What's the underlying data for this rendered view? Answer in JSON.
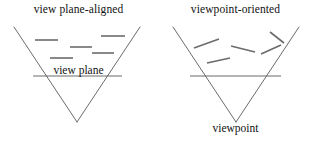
{
  "figure": {
    "background_color": "#ffffff",
    "stroke_color": "#5a5a5a",
    "slice_color": "#6b6b6b",
    "text_color": "#111111"
  },
  "panels": [
    {
      "id": "view-plane-aligned",
      "caption": "view plane-aligned",
      "inline_label": "view plane",
      "frustum": {
        "apex": [
          77,
          122
        ],
        "left_top": [
          14,
          27
        ],
        "right_top": [
          140,
          27
        ]
      },
      "plane_line": {
        "x1": 33,
        "y1": 76,
        "x2": 122,
        "y2": 76
      },
      "slices": [
        {
          "x1": 35,
          "y1": 40,
          "x2": 58,
          "y2": 40
        },
        {
          "x1": 101,
          "y1": 36,
          "x2": 125,
          "y2": 36
        },
        {
          "x1": 70,
          "y1": 47,
          "x2": 92,
          "y2": 47
        },
        {
          "x1": 92,
          "y1": 53,
          "x2": 114,
          "y2": 53
        },
        {
          "x1": 50,
          "y1": 58,
          "x2": 73,
          "y2": 58
        }
      ]
    },
    {
      "id": "viewpoint-oriented",
      "caption": "viewpoint-oriented",
      "inline_label": "viewpoint",
      "frustum": {
        "apex": [
          79,
          122
        ],
        "left_top": [
          16,
          27
        ],
        "right_top": [
          142,
          27
        ]
      },
      "plane_line": {
        "x1": 33,
        "y1": 76,
        "x2": 124,
        "y2": 76
      },
      "slices": [
        {
          "x1": 37,
          "y1": 48,
          "x2": 62,
          "y2": 39
        },
        {
          "x1": 74,
          "y1": 46,
          "x2": 98,
          "y2": 52
        },
        {
          "x1": 104,
          "y1": 54,
          "x2": 124,
          "y2": 45
        },
        {
          "x1": 113,
          "y1": 32,
          "x2": 127,
          "y2": 43
        },
        {
          "x1": 50,
          "y1": 63,
          "x2": 73,
          "y2": 58
        }
      ]
    }
  ]
}
